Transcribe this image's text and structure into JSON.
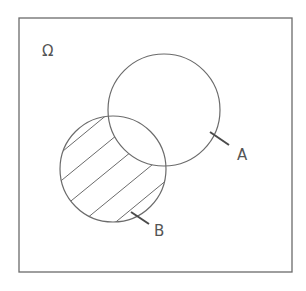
{
  "diagram": {
    "type": "venn",
    "universe": {
      "label": "Ω",
      "x": 19,
      "y": 18,
      "width": 273,
      "height": 254
    },
    "sets": [
      {
        "name": "A",
        "label": "A",
        "cx": 164,
        "cy": 110,
        "r": 56
      },
      {
        "name": "B",
        "label": "B",
        "cx": 113,
        "cy": 169,
        "r": 54
      }
    ],
    "shaded_region": "B \\ A",
    "colors": {
      "stroke": "#6b6b6b",
      "text": "#555555",
      "background": "#ffffff"
    }
  }
}
